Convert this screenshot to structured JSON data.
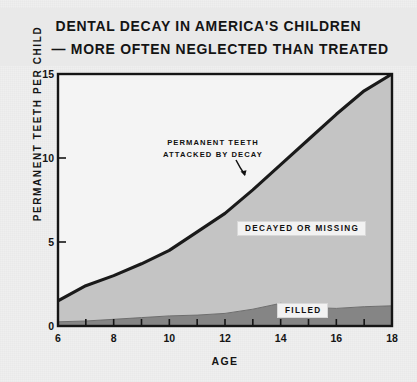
{
  "figure": {
    "title_line_1": "DENTAL DECAY IN AMERICA'S CHILDREN",
    "title_line_2": "— MORE OFTEN NEGLECTED THAN TREATED",
    "caption": ""
  },
  "annotations": {
    "curve_callout_line_1": "PERMANENT TEETH",
    "curve_callout_line_2": "ATTACKED BY DECAY",
    "band_upper_label": "DECAYED OR MISSING",
    "band_lower_label": "FILLED"
  },
  "colors": {
    "paper": "#efefef",
    "ink": "#141414",
    "decayed_or_missing_fill": "#c4c4c4",
    "filled_fill": "#858585",
    "curve": "#1a1a1a",
    "plot_background": "#f4f4f4"
  },
  "chart_data": {
    "type": "area",
    "title": "DENTAL DECAY IN AMERICA'S CHILDREN — MORE OFTEN NEGLECTED THAN TREATED",
    "xlabel": "AGE",
    "ylabel": "PERMANENT TEETH PER CHILD",
    "xlim": [
      6,
      18
    ],
    "ylim": [
      0,
      15
    ],
    "xticks": [
      6,
      7,
      8,
      9,
      10,
      11,
      12,
      13,
      14,
      15,
      16,
      17,
      18
    ],
    "xtick_labels_shown": [
      "6",
      "8",
      "10",
      "12",
      "14",
      "16",
      "18"
    ],
    "yticks": [
      0,
      5,
      10,
      15
    ],
    "ytick_labels_shown": [
      "0",
      "5",
      "10",
      "15"
    ],
    "grid": false,
    "legend": "in-plot labels",
    "x": [
      6,
      7,
      8,
      9,
      10,
      11,
      12,
      13,
      14,
      15,
      16,
      17,
      18
    ],
    "series": [
      {
        "name": "PERMANENT TEETH ATTACKED BY DECAY",
        "role": "upper boundary curve (total)",
        "values": [
          1.5,
          2.4,
          3.0,
          3.7,
          4.5,
          5.6,
          6.7,
          8.1,
          9.6,
          11.1,
          12.6,
          14.0,
          15.0
        ]
      },
      {
        "name": "FILLED",
        "role": "lower band",
        "values": [
          0.25,
          0.3,
          0.4,
          0.5,
          0.6,
          0.65,
          0.75,
          1.0,
          1.35,
          1.1,
          1.05,
          1.15,
          1.2
        ]
      },
      {
        "name": "DECAYED OR MISSING",
        "role": "upper band (difference between total and filled)",
        "values": [
          1.25,
          2.1,
          2.6,
          3.2,
          3.9,
          4.95,
          5.95,
          7.1,
          8.25,
          10.0,
          11.55,
          12.85,
          13.8
        ]
      }
    ]
  }
}
